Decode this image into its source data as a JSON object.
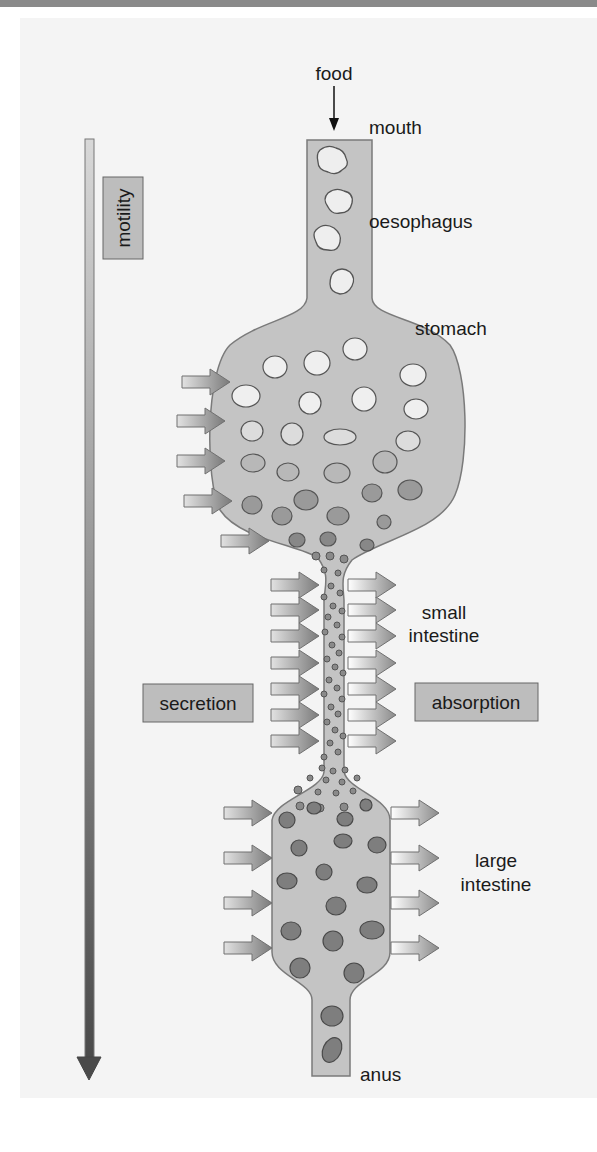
{
  "diagram": {
    "labels": {
      "food": "food",
      "mouth": "mouth",
      "oesophagus": "oesophagus",
      "stomach": "stomach",
      "small_intestine_1": "small",
      "small_intestine_2": "intestine",
      "large_intestine_1": "large",
      "large_intestine_2": "intestine",
      "anus": "anus"
    },
    "process_boxes": {
      "motility": "motility",
      "secretion": "secretion",
      "absorption": "absorption"
    },
    "colors": {
      "background": "#f4f4f4",
      "tract_fill": "#c4c4c4",
      "tract_stroke": "#7a7a7a",
      "box_fill": "#bdbdbd",
      "arrow_dark": "#555555",
      "particle_light": "#eeeeee",
      "particle_dark": "#7a7a7a"
    },
    "arrows": {
      "stomach_secretion_count": 5,
      "small_intestine_secretion_count": 7,
      "small_intestine_absorption_count": 7,
      "large_intestine_secretion_count": 4,
      "large_intestine_absorption_count": 4
    }
  }
}
